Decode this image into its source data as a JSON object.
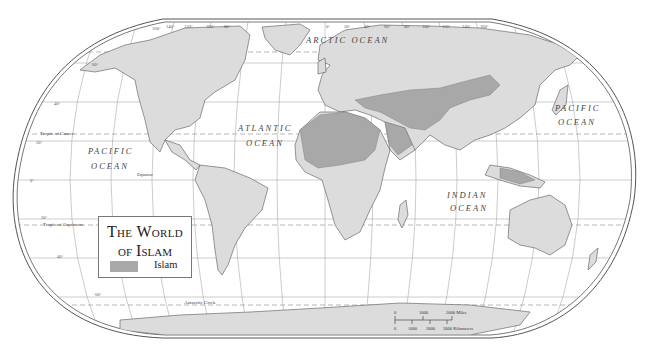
{
  "map": {
    "title_line1": "The World",
    "title_line2": "of Islam",
    "legend": {
      "items": [
        {
          "label": "Islam",
          "color": "#a8a8a8"
        }
      ]
    },
    "colors": {
      "land": "#dcdcdc",
      "islam": "#a8a8a8",
      "ocean": "#ffffff",
      "border": "#555555",
      "graticule": "#999999"
    },
    "ocean_labels": {
      "arctic": "ARCTIC OCEAN",
      "atlantic_1": "ATLANTIC",
      "atlantic_2": "OCEAN",
      "pacific_west_1": "PACIFIC",
      "pacific_west_2": "OCEAN",
      "pacific_east_1": "PACIFIC",
      "pacific_east_2": "OCEAN",
      "indian_1": "INDIAN",
      "indian_2": "OCEAN"
    },
    "lines": {
      "tropic_cancer": "Tropic of Cancer",
      "tropic_capricorn": "Tropic of Capricorn",
      "equator": "Equator",
      "antarctic_circle": "Antarctic Circle"
    },
    "latitude_labels": [
      "60°",
      "40°",
      "20°",
      "0°",
      "20°",
      "40°",
      "60°"
    ],
    "longitude_labels_top": [
      "160°",
      "140°",
      "120°",
      "100°",
      "80°",
      "0°",
      "20°",
      "40°",
      "60°",
      "80°",
      "100°",
      "120°",
      "140°",
      "160°"
    ],
    "scale_bar": {
      "miles_ticks": [
        "0",
        "1000",
        "2000 Miles"
      ],
      "km_ticks": [
        "0",
        "1000",
        "2000",
        "3000 Kilometers"
      ]
    }
  }
}
